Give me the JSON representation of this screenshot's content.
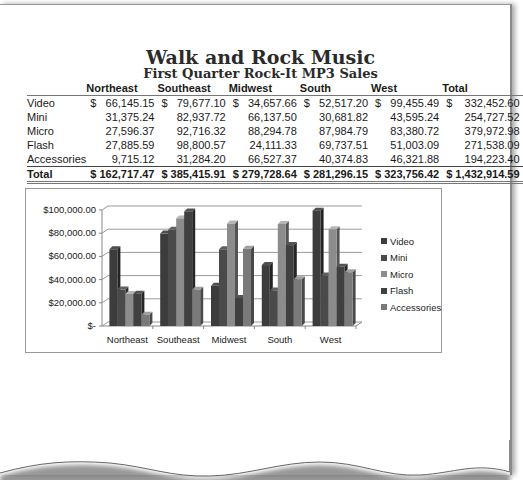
{
  "document": {
    "title": "Walk and Rock Music",
    "subtitle": "First Quarter Rock-It MP3 Sales"
  },
  "table": {
    "columns": [
      "",
      "Northeast",
      "Southeast",
      "Midwest",
      "South",
      "West",
      "Total"
    ],
    "rows": [
      {
        "label": "Video",
        "currency": true,
        "values": [
          "66,145.15",
          "79,677.10",
          "34,657.66",
          "52,517.20",
          "99,455.49",
          "332,452.60"
        ]
      },
      {
        "label": "Mini",
        "currency": false,
        "values": [
          "31,375.24",
          "82,937.72",
          "66,137.50",
          "30,681.82",
          "43,595.24",
          "254,727.52"
        ]
      },
      {
        "label": "Micro",
        "currency": false,
        "values": [
          "27,596.37",
          "92,716.32",
          "88,294.78",
          "87,984.79",
          "83,380.72",
          "379,972.98"
        ]
      },
      {
        "label": "Flash",
        "currency": false,
        "values": [
          "27,885.59",
          "98,800.57",
          "24,111.33",
          "69,737.51",
          "51,003.09",
          "271,538.09"
        ]
      },
      {
        "label": "Accessories",
        "currency": false,
        "values": [
          "9,715.12",
          "31,284.20",
          "66,527.37",
          "40,374.83",
          "46,321.88",
          "194,223.40"
        ]
      }
    ],
    "total": {
      "label": "Total",
      "values": [
        "162,717.47",
        "385,415.91",
        "279,728.64",
        "281,296.15",
        "323,756.42",
        "1,432,914.59"
      ]
    },
    "currency_symbol": "$"
  },
  "chart_data": {
    "type": "bar",
    "style": "3d-clustered-column",
    "title": "",
    "xlabel": "",
    "ylabel": "",
    "categories": [
      "Northeast",
      "Southeast",
      "Midwest",
      "South",
      "West"
    ],
    "series": [
      {
        "name": "Video",
        "color": "#3c3c3c",
        "values": [
          66145.15,
          79677.1,
          34657.66,
          52517.2,
          99455.49
        ]
      },
      {
        "name": "Mini",
        "color": "#4a4a4a",
        "values": [
          31375.24,
          82937.72,
          66137.5,
          30681.82,
          43595.24
        ]
      },
      {
        "name": "Micro",
        "color": "#8c8c8c",
        "values": [
          27596.37,
          92716.32,
          88294.78,
          87984.79,
          83380.72
        ]
      },
      {
        "name": "Flash",
        "color": "#404040",
        "values": [
          27885.59,
          98800.57,
          24111.33,
          69737.51,
          51003.09
        ]
      },
      {
        "name": "Accessories",
        "color": "#7a7a7a",
        "values": [
          9715.12,
          31284.2,
          66527.37,
          40374.83,
          46321.88
        ]
      }
    ],
    "y_ticks": [
      "$100,000.00",
      "$80,000.00",
      "$60,000.00",
      "$40,000.00",
      "$20,000.00",
      "$-"
    ],
    "ylim": [
      0,
      100000
    ],
    "grid": true,
    "legend_position": "right"
  }
}
